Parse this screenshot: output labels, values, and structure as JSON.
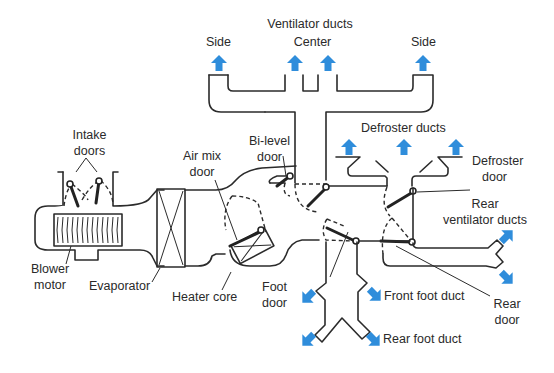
{
  "diagram": {
    "arrow_color": "#2f8ddb",
    "line_color": "#2b2b2b",
    "labels": {
      "ventilator_ducts": "Ventilator ducts",
      "center": "Center",
      "side_left": "Side",
      "side_right": "Side",
      "defroster_ducts": "Defroster ducts",
      "defroster_door_1": "Defroster",
      "defroster_door_2": "door",
      "rear_vent_1": "Rear",
      "rear_vent_2": "ventilator ducts",
      "intake_doors_1": "Intake",
      "intake_doors_2": "doors",
      "air_mix_1": "Air mix",
      "air_mix_2": "door",
      "bi_level_1": "Bi-level",
      "bi_level_2": "door",
      "blower_1": "Blower",
      "blower_2": "motor",
      "evaporator": "Evaporator",
      "heater_core": "Heater core",
      "foot_door_1": "Foot",
      "foot_door_2": "door",
      "front_foot_duct": "Front foot duct",
      "rear_foot_duct": "Rear foot duct",
      "rear_door_1": "Rear",
      "rear_door_2": "door"
    },
    "components": [
      "Intake doors",
      "Blower motor",
      "Evaporator",
      "Heater core",
      "Air mix door",
      "Bi-level door",
      "Ventilator ducts (Side, Center, Side)",
      "Defroster ducts",
      "Defroster door",
      "Rear ventilator ducts",
      "Foot door",
      "Front foot duct",
      "Rear foot duct",
      "Rear door"
    ]
  }
}
